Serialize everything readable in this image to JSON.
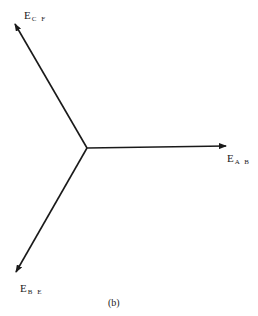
{
  "diagram": {
    "type": "phasor-diagram",
    "origin": [
      87,
      148
    ],
    "vectors": [
      {
        "id": "ab",
        "main": "E",
        "sub": "A B",
        "tip": [
          226,
          146
        ],
        "label_pos": [
          227,
          153
        ]
      },
      {
        "id": "cf",
        "main": "E",
        "sub": "C F",
        "tip": [
          15,
          24
        ],
        "label_pos": [
          24,
          10
        ]
      },
      {
        "id": "be",
        "main": "E",
        "sub": "B E",
        "tip": [
          16,
          272
        ],
        "label_pos": [
          20,
          283
        ]
      }
    ],
    "caption": "(b)",
    "caption_pos": [
      108,
      297
    ],
    "stroke_color": "#1a1a1a"
  }
}
